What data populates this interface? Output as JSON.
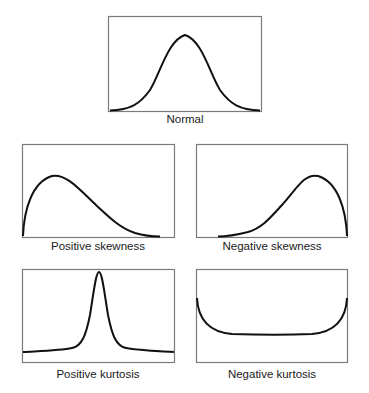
{
  "figure": {
    "background": "#ffffff",
    "frame_color": "#7a7a7a",
    "curve_color": "#111111",
    "panels": [
      {
        "id": "normal",
        "label": "Normal"
      },
      {
        "id": "positive-skewness",
        "label": "Positive skewness"
      },
      {
        "id": "negative-skewness",
        "label": "Negative skewness"
      },
      {
        "id": "positive-kurtosis",
        "label": "Positive kurtosis"
      },
      {
        "id": "negative-kurtosis",
        "label": "Negative kurtosis"
      }
    ]
  }
}
